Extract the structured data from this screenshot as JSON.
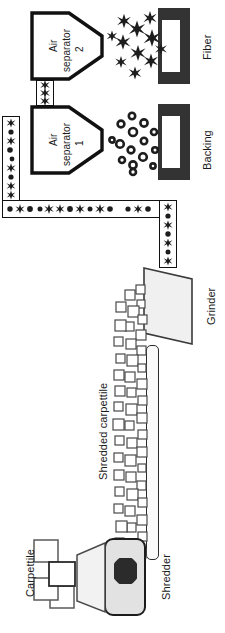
{
  "diagram": {
    "orientation": "rotated-90",
    "labels": {
      "carpettile": "Carpettile",
      "shredder": "Shredder",
      "shredded_carpettile": "Shredded carpettile",
      "grinder": "Grinder",
      "air_separator_1_line1": "Air",
      "air_separator_1_line2": "separator",
      "air_separator_1_line3": "1",
      "air_separator_2_line1": "Air",
      "air_separator_2_line2": "separator",
      "air_separator_2_line3": "2",
      "backing": "Backing",
      "fiber": "Fiber"
    },
    "colors": {
      "outline": "#111111",
      "machine_fill": "#e2e2e2",
      "blade": "#2b2b2b",
      "bin": "#333333",
      "grinder_fill": "#f0f0f0",
      "tile_stroke": "#555555",
      "background": "#ffffff"
    },
    "nodes": [
      {
        "id": "carpettile",
        "label": "Carpettile",
        "kind": "material-input"
      },
      {
        "id": "hopper",
        "label": "",
        "kind": "feed-hopper"
      },
      {
        "id": "shredder",
        "label": "Shredder",
        "kind": "machine"
      },
      {
        "id": "conveyor",
        "label": "Shredded carpettile",
        "kind": "conveyor"
      },
      {
        "id": "grinder",
        "label": "Grinder",
        "kind": "machine"
      },
      {
        "id": "duct",
        "label": "",
        "kind": "pneumatic-duct"
      },
      {
        "id": "air-separator-1",
        "label": "Air separator 1",
        "kind": "separator"
      },
      {
        "id": "backing",
        "label": "Backing",
        "kind": "product-bin"
      },
      {
        "id": "air-separator-2",
        "label": "Air separator 2",
        "kind": "separator"
      },
      {
        "id": "fiber",
        "label": "Fiber",
        "kind": "product-bin"
      }
    ],
    "flow": [
      "Carpettile",
      "Shredder",
      "Shredded carpettile",
      "Grinder",
      "Air separator 1",
      "Backing",
      "Air separator 2",
      "Fiber"
    ]
  }
}
